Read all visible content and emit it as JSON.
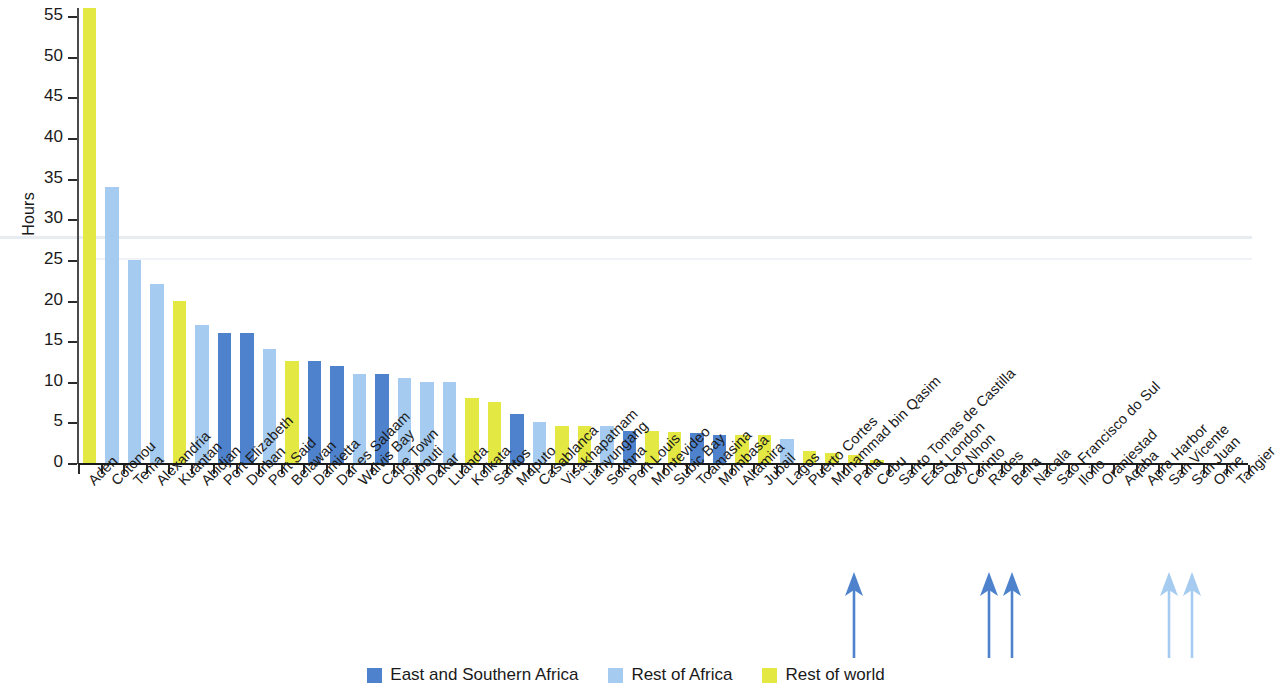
{
  "chart_data": {
    "type": "bar",
    "title": "",
    "xlabel": "",
    "ylabel": "Hours",
    "ylim": [
      0,
      56
    ],
    "ytick_values": [
      0,
      5,
      10,
      15,
      20,
      25,
      30,
      35,
      40,
      45,
      50,
      55
    ],
    "grid": false,
    "legend_position": "bottom-center",
    "legend": [
      {
        "key": "east",
        "label": "East and Southern Africa",
        "color": "#4f82cc"
      },
      {
        "key": "rest-africa",
        "label": "Rest of Africa",
        "color": "#a5cbf0"
      },
      {
        "key": "rest-world",
        "label": "Rest of world",
        "color": "#e3e843"
      }
    ],
    "categories": [
      "Aden",
      "Cotonou",
      "Tema",
      "Alexandria",
      "Kuantan",
      "Abidjan",
      "Port Elizabeth",
      "Durban",
      "Port Said",
      "Belawan",
      "Damietta",
      "Dar es Salaam",
      "Walvis Bay",
      "Cape Town",
      "Djibouti",
      "Dakar",
      "Luanda",
      "Kolkata",
      "Santos",
      "Maputo",
      "Casablanca",
      "Visakhapatnam",
      "Lianyungang",
      "Sokhna",
      "Port Louis",
      "Montevideo",
      "Subic Bay",
      "Toamasina",
      "Mombasa",
      "Altamira",
      "Jubail",
      "Lagos",
      "Puerto Cortes",
      "Muhammad bin Qasim",
      "Paita",
      "Cebu",
      "Santo Tomas de Castilla",
      "East London",
      "Quy Nhon",
      "Corinto",
      "Rades",
      "Beira",
      "Nacala",
      "Sao Francisco do Sul",
      "Iloilo",
      "Oranjestad",
      "Aqaba",
      "Apra Harbor",
      "San Vicente",
      "San Juan",
      "Onne",
      "Tangier"
    ],
    "values": [
      56,
      34,
      25,
      22,
      20,
      17,
      16,
      16,
      14,
      12.5,
      12.5,
      12,
      11,
      11,
      10.5,
      10,
      10,
      8,
      7.5,
      6,
      5,
      4.5,
      4.5,
      4.5,
      4,
      4,
      3.8,
      3.7,
      3.5,
      3.4,
      3.4,
      3,
      1.5,
      1.2,
      1,
      0.35,
      0,
      0,
      0,
      0,
      0,
      0,
      0,
      0,
      0,
      0,
      0,
      0,
      0,
      0,
      0,
      0
    ],
    "series_keys": [
      "rest-world",
      "rest-africa",
      "rest-africa",
      "rest-africa",
      "rest-world",
      "rest-africa",
      "east",
      "east",
      "rest-africa",
      "rest-world",
      "east",
      "east",
      "rest-africa",
      "east",
      "rest-africa",
      "rest-africa",
      "rest-africa",
      "rest-world",
      "rest-world",
      "east",
      "rest-africa",
      "rest-world",
      "rest-world",
      "rest-africa",
      "east",
      "rest-world",
      "rest-world",
      "east",
      "east",
      "rest-world",
      "rest-world",
      "rest-africa",
      "rest-world",
      "rest-world",
      "rest-world",
      "rest-world",
      "rest-world",
      "east",
      "rest-world",
      "rest-world",
      "east",
      "east",
      "east",
      "east",
      "rest-world",
      "rest-world",
      "rest-world",
      "rest-world",
      "rest-africa",
      "rest-africa",
      "rest-africa",
      "east"
    ],
    "annotations": [
      {
        "name": "arrow-paita",
        "category": "Paita",
        "index": 34,
        "color": "#4f82cc"
      },
      {
        "name": "arrow-rades",
        "category": "Rades",
        "index": 40,
        "color": "#4f82cc"
      },
      {
        "name": "arrow-beira",
        "category": "Beira",
        "index": 41,
        "color": "#4f82cc"
      },
      {
        "name": "arrow-san-vicente",
        "category": "San Vicente",
        "index": 48,
        "color": "#a5cbf0"
      },
      {
        "name": "arrow-san-juan",
        "category": "San Juan",
        "index": 49,
        "color": "#a5cbf0"
      }
    ]
  }
}
